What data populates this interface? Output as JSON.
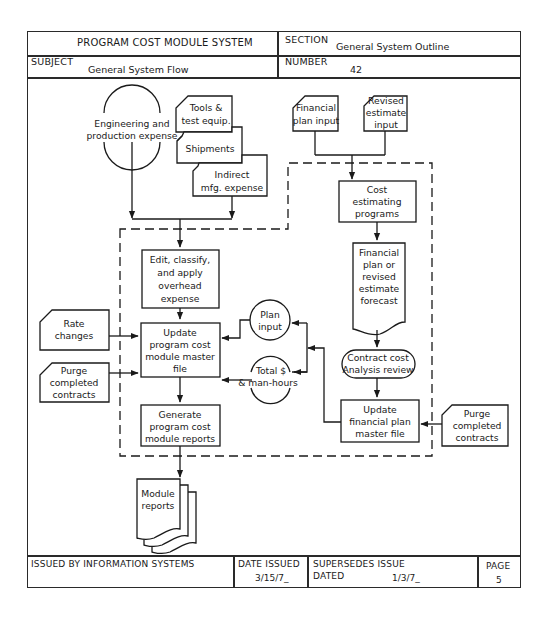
{
  "header": {
    "system_title": "PROGRAM COST MODULE SYSTEM",
    "section_label": "SECTION",
    "section_value": "General System Outline",
    "subject_label": "SUBJECT",
    "subject_value": "General System Flow",
    "number_label": "NUMBER",
    "number_value": "42"
  },
  "diagram": {
    "engineering": [
      "Engineering and",
      "production expense"
    ],
    "tools": [
      "Tools &",
      "test equip."
    ],
    "shipments": [
      "Shipments"
    ],
    "indirect": [
      "Indirect",
      "mfg. expense"
    ],
    "financial_plan_input": [
      "Financial",
      "plan input"
    ],
    "revised_estimate_input": [
      "Revised",
      "estimate",
      "input"
    ],
    "edit_classify": [
      "Edit, classify,",
      "and apply",
      "overhead",
      "expense"
    ],
    "cost_estimating": [
      "Cost",
      "estimating",
      "programs"
    ],
    "forecast": [
      "Financial",
      "plan or",
      "revised",
      "estimate",
      "forecast"
    ],
    "rate_changes": [
      "Rate",
      "changes"
    ],
    "update_pcm": [
      "Update",
      "program cost",
      "module master",
      "file"
    ],
    "plan_input": [
      "Plan",
      "input"
    ],
    "total_man_hours": [
      "Total $",
      "& man-hours"
    ],
    "contract_review": [
      "Contract cost",
      "Analysis review"
    ],
    "purge_left": [
      "Purge",
      "completed",
      "contracts"
    ],
    "purge_right": [
      "Purge",
      "completed",
      "contracts"
    ],
    "generate_reports": [
      "Generate",
      "program cost",
      "module reports"
    ],
    "update_financial": [
      "Update",
      "financial plan",
      "master file"
    ],
    "module_reports": [
      "Module",
      "reports"
    ]
  },
  "footer": {
    "issued_by": "ISSUED BY INFORMATION SYSTEMS",
    "date_issued_label": "DATE ISSUED",
    "date_issued_value": "3/15/7_",
    "supersedes_label": "SUPERSEDES ISSUE",
    "dated_label": "DATED",
    "dated_value": "1/3/7_",
    "page_label": "PAGE",
    "page_value": "5"
  },
  "colors": {
    "ink": "#1a1a1a",
    "paper": "#ffffff"
  }
}
